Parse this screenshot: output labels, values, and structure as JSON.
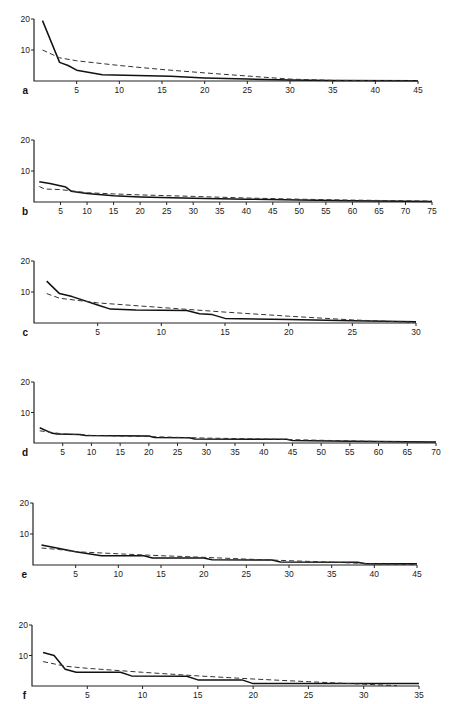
{
  "figure": {
    "panels": [
      "a",
      "b",
      "c",
      "d",
      "e",
      "f"
    ]
  },
  "chart_data": [
    {
      "type": "line",
      "panel": "a",
      "title": "",
      "xlabel": "",
      "ylabel": "",
      "xlim": [
        0,
        45
      ],
      "ylim": [
        0,
        20
      ],
      "xticks": [
        5,
        10,
        15,
        20,
        25,
        30,
        35,
        40,
        45
      ],
      "yticks": [
        10,
        20
      ],
      "series": [
        {
          "name": "observed",
          "style": "solid",
          "x": [
            1,
            3,
            4,
            5,
            8,
            16,
            20,
            25,
            30,
            35,
            45
          ],
          "y": [
            19.5,
            6,
            5,
            3.5,
            2,
            1.5,
            1,
            0.6,
            0.3,
            0.2,
            0.1
          ]
        },
        {
          "name": "expected",
          "style": "dashed",
          "x": [
            1,
            3,
            5,
            10,
            15,
            20,
            25,
            30,
            35,
            45
          ],
          "y": [
            10,
            7.5,
            6.5,
            5,
            3.7,
            2.6,
            1.6,
            0.6,
            0.2,
            0.1
          ]
        }
      ]
    },
    {
      "type": "line",
      "panel": "b",
      "title": "",
      "xlabel": "",
      "ylabel": "",
      "xlim": [
        0,
        75
      ],
      "ylim": [
        0,
        20
      ],
      "xticks": [
        5,
        10,
        15,
        20,
        25,
        30,
        35,
        40,
        45,
        50,
        55,
        60,
        65,
        70,
        75
      ],
      "yticks": [
        10,
        20
      ],
      "series": [
        {
          "name": "observed",
          "style": "solid",
          "x": [
            1,
            3,
            6,
            7,
            10,
            15,
            20,
            30,
            40,
            50,
            60,
            75
          ],
          "y": [
            6.5,
            6,
            4.8,
            3.5,
            2.7,
            2,
            1.6,
            1.2,
            0.9,
            0.6,
            0.4,
            0.2
          ]
        },
        {
          "name": "expected",
          "style": "dashed",
          "x": [
            1,
            2,
            5,
            10,
            15,
            20,
            30,
            40,
            50,
            60,
            75
          ],
          "y": [
            5,
            4.2,
            4,
            3,
            2.6,
            2.3,
            1.8,
            1.3,
            0.9,
            0.6,
            0.3
          ]
        }
      ]
    },
    {
      "type": "line",
      "panel": "c",
      "title": "",
      "xlabel": "",
      "ylabel": "",
      "xlim": [
        0,
        30
      ],
      "ylim": [
        0,
        20
      ],
      "xticks": [
        5,
        10,
        15,
        20,
        25,
        30
      ],
      "yticks": [
        10,
        20
      ],
      "series": [
        {
          "name": "observed",
          "style": "solid",
          "x": [
            1,
            2,
            3,
            5,
            6,
            8,
            12,
            13,
            14,
            15,
            20,
            25,
            30
          ],
          "y": [
            13.5,
            9.5,
            8.5,
            5.8,
            4.5,
            4.2,
            4,
            3,
            2.7,
            1.5,
            1.1,
            0.7,
            0.4
          ]
        },
        {
          "name": "expected",
          "style": "dashed",
          "x": [
            1,
            2,
            4,
            5,
            10,
            15,
            20,
            25,
            30
          ],
          "y": [
            9.5,
            8,
            7,
            6.5,
            5,
            3.5,
            2.2,
            1,
            0.2
          ]
        }
      ]
    },
    {
      "type": "line",
      "panel": "d",
      "title": "",
      "xlabel": "",
      "ylabel": "",
      "xlim": [
        0,
        70
      ],
      "ylim": [
        0,
        20
      ],
      "xticks": [
        5,
        10,
        15,
        20,
        25,
        30,
        35,
        40,
        45,
        50,
        55,
        60,
        65,
        70
      ],
      "yticks": [
        10,
        20
      ],
      "series": [
        {
          "name": "observed",
          "style": "solid",
          "x": [
            1,
            3,
            4,
            8,
            9,
            20,
            21,
            27,
            28,
            44,
            45,
            55,
            65,
            70
          ],
          "y": [
            5,
            3.3,
            3,
            2.8,
            2.5,
            2.3,
            1.8,
            1.7,
            1.3,
            1.2,
            0.8,
            0.6,
            0.4,
            0.3
          ]
        },
        {
          "name": "expected",
          "style": "dashed",
          "x": [
            1,
            5,
            10,
            20,
            30,
            40,
            50,
            60,
            70
          ],
          "y": [
            4,
            3,
            2.5,
            2.1,
            1.6,
            1.3,
            0.9,
            0.5,
            0.2
          ]
        }
      ]
    },
    {
      "type": "line",
      "panel": "e",
      "title": "",
      "xlabel": "",
      "ylabel": "",
      "xlim": [
        0,
        45
      ],
      "ylim": [
        0,
        20
      ],
      "xticks": [
        5,
        10,
        15,
        20,
        25,
        30,
        35,
        40,
        45
      ],
      "yticks": [
        10,
        20
      ],
      "series": [
        {
          "name": "observed",
          "style": "solid",
          "x": [
            1,
            5,
            8,
            13,
            14,
            20,
            21,
            28,
            29,
            38,
            39,
            45
          ],
          "y": [
            6.5,
            4.3,
            3,
            3,
            2.3,
            2.3,
            1.7,
            1.6,
            1,
            0.9,
            0.4,
            0.4
          ]
        },
        {
          "name": "expected",
          "style": "dashed",
          "x": [
            1,
            3,
            5,
            10,
            15,
            20,
            25,
            30,
            35,
            40,
            45
          ],
          "y": [
            5.5,
            5,
            4.3,
            3.6,
            3,
            2.5,
            1.9,
            1.4,
            0.9,
            0.4,
            0.1
          ]
        }
      ]
    },
    {
      "type": "line",
      "panel": "f",
      "title": "",
      "xlabel": "",
      "ylabel": "",
      "xlim": [
        0,
        35
      ],
      "ylim": [
        0,
        20
      ],
      "xticks": [
        5,
        10,
        15,
        20,
        25,
        30,
        35
      ],
      "yticks": [
        10,
        20
      ],
      "series": [
        {
          "name": "observed",
          "style": "solid",
          "x": [
            1,
            2,
            3,
            4,
            8,
            9,
            14,
            15,
            19,
            20,
            35
          ],
          "y": [
            11,
            10,
            5.5,
            4.5,
            4.5,
            3.3,
            3.2,
            2,
            2,
            0.8,
            0.8
          ]
        },
        {
          "name": "expected",
          "style": "dashed",
          "x": [
            1,
            3,
            5,
            10,
            15,
            20,
            25,
            30,
            33
          ],
          "y": [
            8,
            6.5,
            5.8,
            4.5,
            3.3,
            2.3,
            1.4,
            0.6,
            0.1
          ]
        }
      ]
    }
  ]
}
